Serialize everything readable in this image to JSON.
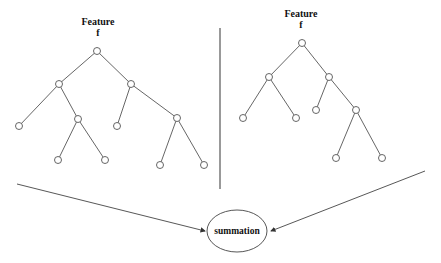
{
  "left_tree": {
    "label_line1": "Feature",
    "label_line2": "f"
  },
  "right_tree": {
    "label_line1": "Feature",
    "label_line2": "f"
  },
  "combine_node": {
    "label": "summation"
  },
  "colors": {
    "line": "#444444",
    "node_fill": "#ffffff",
    "text": "#111111"
  }
}
